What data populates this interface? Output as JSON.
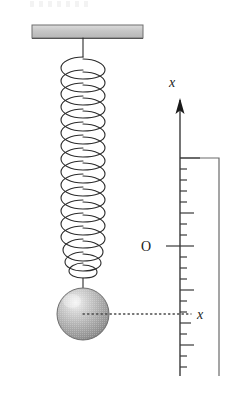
{
  "figure": {
    "background_color": "#ffffff",
    "width": 245,
    "height": 394
  },
  "ceiling": {
    "name": "ceiling-support-bar",
    "x": 32,
    "y": 25,
    "width": 111,
    "height": 13,
    "fill_color": "#c9c9c9",
    "edge_color": "#6e6e6e"
  },
  "spring": {
    "name": "coil-spring",
    "top_y": 38,
    "bottom_y": 288,
    "center_x": 83,
    "coil_count": 17,
    "coil_radius": 22,
    "stroke_color": "#2b2b2b",
    "stroke_width": 1.1,
    "top_stem_length": 17,
    "bottom_stem_length": 10
  },
  "mass": {
    "name": "hanging-ball-mass",
    "center_x": 83,
    "center_y": 314,
    "radius": 26,
    "fill_light": "#efefef",
    "fill_mid": "#b4b4b4",
    "fill_dark": "#8a8a8a",
    "edge_color": "#6f6f6f",
    "highlight_x": 72,
    "highlight_y": 300
  },
  "axis": {
    "name": "vertical-x-axis",
    "x": 180,
    "top_y": 100,
    "bottom_y": 376,
    "stroke_color": "#3a3a3a",
    "stroke_width": 1.4,
    "arrow_label": "x",
    "arrow_label_x": 172,
    "arrow_label_y": 87,
    "arrow_tip_y": 100,
    "arrow_width": 9,
    "arrow_height": 15,
    "direction": "up-positive"
  },
  "ticks": {
    "name": "axis-tick-marks",
    "first_y": 158,
    "spacing": 11,
    "count": 20,
    "minor_length": 7,
    "major_length": 14,
    "major_every": 5,
    "origin_index": 8,
    "origin_length": 22,
    "stroke_color": "#3a3a3a"
  },
  "origin": {
    "name": "origin-marker",
    "label": "O",
    "label_x": 146,
    "label_y": 248,
    "tick_y": 246
  },
  "displacement": {
    "name": "displacement-indicator",
    "label": "x",
    "label_x": 196,
    "label_y": 319,
    "dotted_from_x": 83,
    "dotted_to_x": 191,
    "dotted_y": 314,
    "dot_color": "#4a4a4a"
  },
  "bracket": {
    "name": "amplitude-range-bracket",
    "top_y": 158,
    "left_x": 180,
    "right_x": 219,
    "bottom_y": 376,
    "stroke_color": "#6a6a6a",
    "stroke_width": 1.2
  },
  "colors": {
    "ink": "#1a1a1a",
    "axis_gray": "#3a3a3a",
    "bracket_gray": "#6a6a6a",
    "ceiling_gray": "#c9c9c9",
    "ball_gray": "#b4b4b4"
  }
}
